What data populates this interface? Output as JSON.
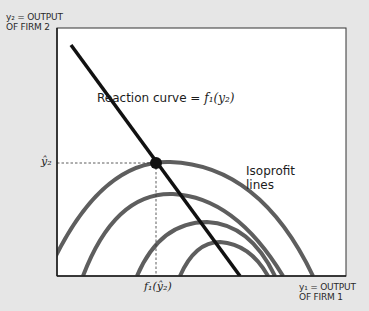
{
  "diagram": {
    "y_axis_label_line1": "y₂ = OUTPUT",
    "y_axis_label_line2": "OF FIRM 2",
    "x_axis_label_line1": "y₁ = OUTPUT",
    "x_axis_label_line2": "OF FIRM 1",
    "reaction_curve_label": "Reaction curve = ",
    "reaction_curve_function": "f₁(y₂)",
    "isoprofit_label_line1": "Isoprofit",
    "isoprofit_label_line2": "lines",
    "y_tick_label": "ŷ₂",
    "x_tick_label": "f₁(ŷ₂)",
    "colors": {
      "background": "#e6e6e6",
      "plot_area": "#ffffff",
      "reaction_line": "#111111",
      "isoprofit_lines": "#5e5e5e",
      "axis": "#1a1a1a"
    }
  }
}
